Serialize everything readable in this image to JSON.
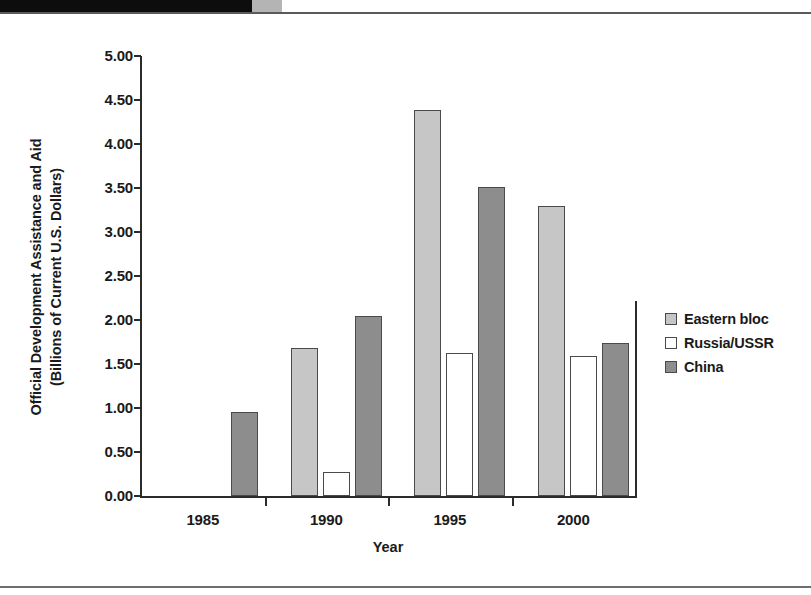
{
  "page": {
    "artifacts": {
      "top_black_bar": "scan-edge-black-bar",
      "top_gray_tab": "scan-edge-gray-tab",
      "top_rule": "page-top-rule",
      "bottom_rule": "page-bottom-rule"
    }
  },
  "chart_data": {
    "type": "bar",
    "title": "",
    "xlabel": "Year",
    "ylabel": "Official Development Assistance and Aid (Billions of Current U.S. Dollars)",
    "ylabel_line1": "Official Development Assistance and Aid",
    "ylabel_line2": "(Billions of Current U.S. Dollars)",
    "categories": [
      "1985",
      "1990",
      "1995",
      "2000"
    ],
    "series": [
      {
        "name": "Eastern bloc",
        "color": "#c6c6c6",
        "values": [
          null,
          1.68,
          4.39,
          3.29
        ]
      },
      {
        "name": "Russia/USSR",
        "color": "#ffffff",
        "values": [
          null,
          0.27,
          1.63,
          1.59
        ]
      },
      {
        "name": "China",
        "color": "#8d8d8d",
        "values": [
          0.95,
          2.04,
          3.51,
          1.74
        ]
      }
    ],
    "ylim": [
      0.0,
      5.0
    ],
    "ytick_labels": [
      "5.00",
      "4.50",
      "4.00",
      "3.50",
      "3.00",
      "2.50",
      "2.00",
      "1.50",
      "1.00",
      "0.50",
      "0.00"
    ],
    "ytick_values": [
      5.0,
      4.5,
      4.0,
      3.5,
      3.0,
      2.5,
      2.0,
      1.5,
      1.0,
      0.5,
      0.0
    ],
    "grid": false,
    "legend_position": "right"
  },
  "legend": {
    "items": [
      {
        "label": "Eastern bloc",
        "color": "#c6c6c6"
      },
      {
        "label": "Russia/USSR",
        "color": "#ffffff"
      },
      {
        "label": "China",
        "color": "#8d8d8d"
      }
    ]
  }
}
